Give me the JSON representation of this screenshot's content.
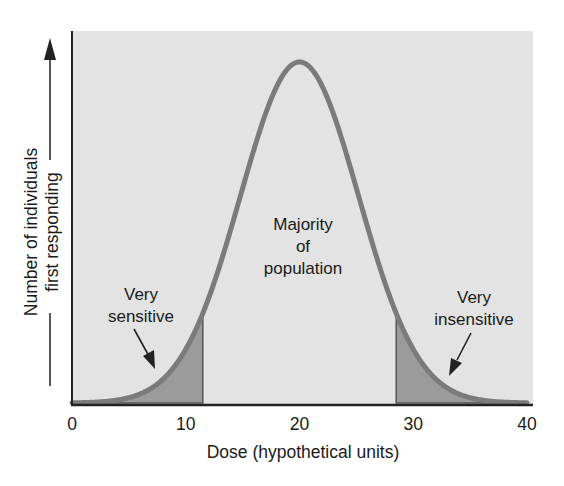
{
  "chart_data": {
    "type": "area",
    "title": "",
    "xlabel": "Dose (hypothetical units)",
    "ylabel_lines": [
      "Number of individuals",
      "first responding"
    ],
    "xlim": [
      0,
      40
    ],
    "x_ticks": [
      0,
      10,
      20,
      30,
      40
    ],
    "x_tick_labels": [
      "0",
      "10",
      "20",
      "30",
      "40"
    ],
    "y_ticks": [],
    "grid": false,
    "distribution": {
      "shape": "normal",
      "mean": 20,
      "sd": 5.2
    },
    "shaded_regions": [
      {
        "name": "Very sensitive",
        "x_from": 0,
        "x_to": 11.5
      },
      {
        "name": "Very insensitive",
        "x_from": 28.5,
        "x_to": 40
      }
    ],
    "annotations": [
      {
        "text_lines": [
          "Majority",
          "of",
          "population"
        ],
        "x": 20
      },
      {
        "text_lines": [
          "Very",
          "sensitive"
        ],
        "arrow_to_x": 7.5
      },
      {
        "text_lines": [
          "Very",
          "insensitive"
        ],
        "arrow_to_x": 33
      }
    ]
  },
  "colors": {
    "panel": "#e3e3e3",
    "curve": "#7b7b7b",
    "shade": "#9b9b9b",
    "axis": "#222222",
    "text": "#1a1a1a"
  }
}
